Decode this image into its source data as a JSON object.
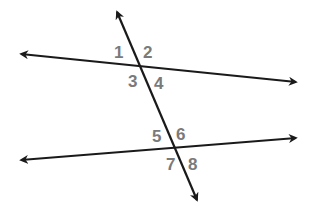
{
  "diagram": {
    "colors": {
      "line": "#1a1a1a",
      "label": "#7a7a7a",
      "background": "#ffffff"
    },
    "lines": [
      {
        "id": "top-line",
        "x1": 21,
        "y1": 54,
        "x2": 296,
        "y2": 82
      },
      {
        "id": "bottom-line",
        "x1": 21,
        "y1": 160,
        "x2": 296,
        "y2": 138
      },
      {
        "id": "transversal",
        "x1": 117,
        "y1": 12,
        "x2": 197,
        "y2": 200
      }
    ],
    "angle_labels": [
      {
        "text": "1",
        "x": 114,
        "y": 58
      },
      {
        "text": "2",
        "x": 143,
        "y": 58
      },
      {
        "text": "3",
        "x": 128,
        "y": 87
      },
      {
        "text": "4",
        "x": 154,
        "y": 89
      },
      {
        "text": "5",
        "x": 152,
        "y": 142
      },
      {
        "text": "6",
        "x": 176,
        "y": 140
      },
      {
        "text": "7",
        "x": 166,
        "y": 170
      },
      {
        "text": "8",
        "x": 188,
        "y": 170
      }
    ]
  }
}
